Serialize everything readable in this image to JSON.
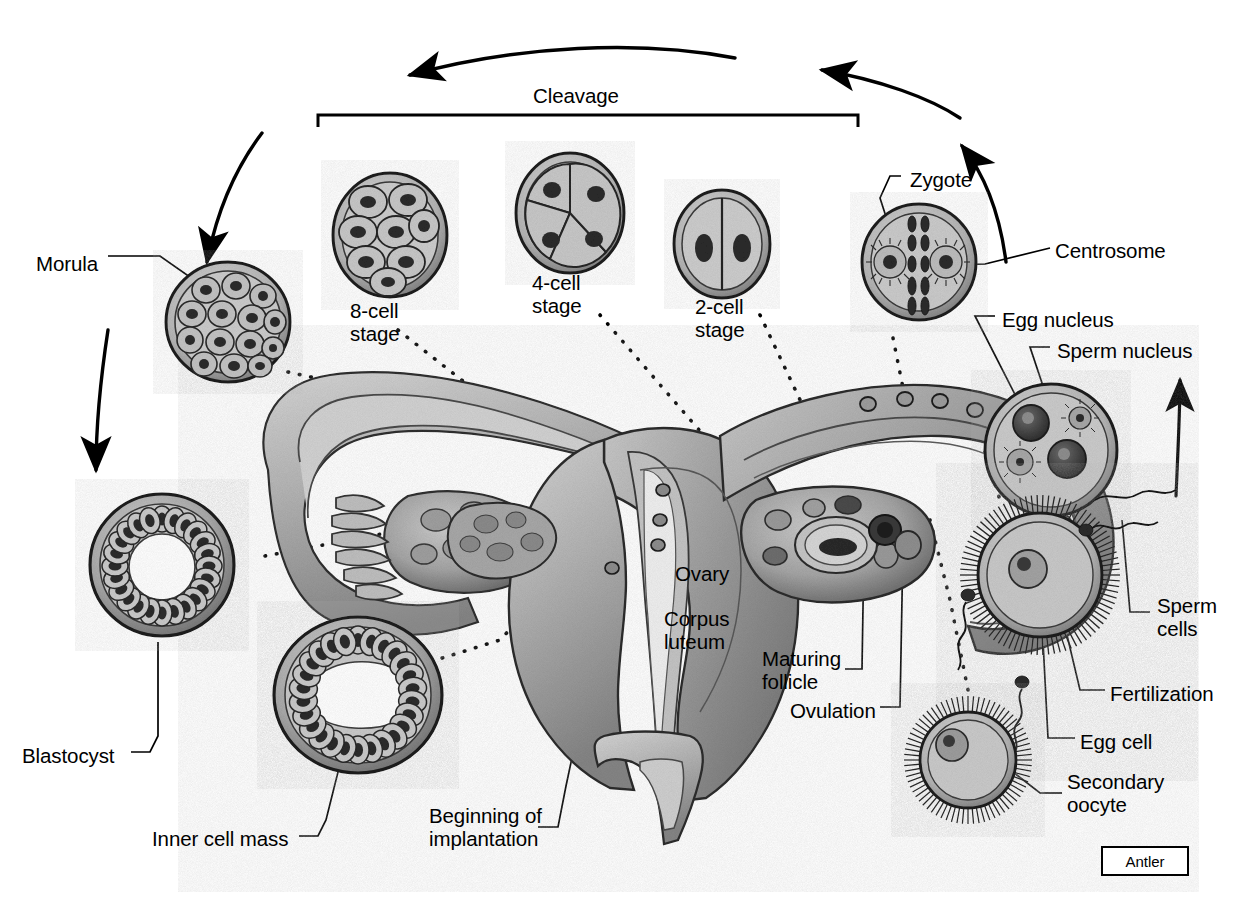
{
  "figure": {
    "credit_box": "Antler",
    "background_color": "#ffffff",
    "ink_color": "#000000"
  },
  "labels": [
    {
      "id": "cleavage",
      "text": "Cleavage",
      "x": 533,
      "y": 85,
      "name": "label-cleavage"
    },
    {
      "id": "morula",
      "text": "Morula",
      "x": 36,
      "y": 253,
      "name": "label-morula"
    },
    {
      "id": "eight_cell_stage",
      "text": "8-cell\nstage",
      "x": 350,
      "y": 300,
      "name": "label-8-cell-stage"
    },
    {
      "id": "four_cell_stage",
      "text": "4-cell\nstage",
      "x": 532,
      "y": 272,
      "name": "label-4-cell-stage"
    },
    {
      "id": "two_cell_stage",
      "text": "2-cell\nstage",
      "x": 695,
      "y": 296,
      "name": "label-2-cell-stage"
    },
    {
      "id": "zygote",
      "text": "Zygote",
      "x": 910,
      "y": 169,
      "name": "label-zygote"
    },
    {
      "id": "centrosome",
      "text": "Centrosome",
      "x": 1055,
      "y": 240,
      "name": "label-centrosome"
    },
    {
      "id": "egg_nucleus",
      "text": "Egg nucleus",
      "x": 1002,
      "y": 309,
      "name": "label-egg-nucleus"
    },
    {
      "id": "sperm_nucleus",
      "text": "Sperm nucleus",
      "x": 1057,
      "y": 340,
      "name": "label-sperm-nucleus"
    },
    {
      "id": "sperm_cells",
      "text": "Sperm\ncells",
      "x": 1157,
      "y": 595,
      "name": "label-sperm-cells"
    },
    {
      "id": "fertilization",
      "text": "Fertilization",
      "x": 1110,
      "y": 683,
      "name": "label-fertilization"
    },
    {
      "id": "egg_cell",
      "text": "Egg cell",
      "x": 1080,
      "y": 731,
      "name": "label-egg-cell"
    },
    {
      "id": "secondary_oocyte",
      "text": "Secondary\noocyte",
      "x": 1067,
      "y": 771,
      "name": "label-secondary-oocyte"
    },
    {
      "id": "ovulation",
      "text": "Ovulation",
      "x": 790,
      "y": 700,
      "name": "label-ovulation"
    },
    {
      "id": "maturing_follicle",
      "text": "Maturing\nfollicle",
      "x": 762,
      "y": 648,
      "name": "label-maturing-follicle"
    },
    {
      "id": "corpus_luteum",
      "text": "Corpus\nluteum",
      "x": 664,
      "y": 608,
      "name": "label-corpus-luteum"
    },
    {
      "id": "ovary",
      "text": "Ovary",
      "x": 675,
      "y": 563,
      "name": "label-ovary"
    },
    {
      "id": "beginning_implantation",
      "text": "Beginning of\nimplantation",
      "x": 429,
      "y": 805,
      "name": "label-beginning-of-implantation"
    },
    {
      "id": "inner_cell_mass",
      "text": "Inner cell mass",
      "x": 152,
      "y": 828,
      "name": "label-inner-cell-mass"
    },
    {
      "id": "blastocyst",
      "text": "Blastocyst",
      "x": 22,
      "y": 745,
      "name": "label-blastocyst"
    }
  ],
  "structures": [
    {
      "id": "morula_cell",
      "name": "morula-embryo",
      "note": "solid ball of ~16 cells"
    },
    {
      "id": "blastocyst_upper",
      "name": "blastocyst-embryo",
      "note": "hollow sphere with single cell layer"
    },
    {
      "id": "blastocyst_lower",
      "name": "blastocyst-inner-cell-mass-embryo",
      "note": "hollow sphere with inner cell mass"
    },
    {
      "id": "eight_cell",
      "name": "eight-cell-embryo",
      "note": "8 blastomeres"
    },
    {
      "id": "four_cell",
      "name": "four-cell-embryo",
      "note": "4 blastomeres"
    },
    {
      "id": "two_cell",
      "name": "two-cell-embryo",
      "note": "2 blastomeres"
    },
    {
      "id": "zygote_cell",
      "name": "zygote-cell",
      "note": "two centrosomes with chromosomes at metaphase"
    },
    {
      "id": "pronuclei_cell",
      "name": "pronuclei-cell",
      "note": "egg nucleus and sperm nucleus with asters"
    },
    {
      "id": "fertilization_cell",
      "name": "fertilization-egg-cell",
      "note": "egg with corona radiata, sperm entering"
    },
    {
      "id": "secondary_oocyte_cell",
      "name": "secondary-oocyte-cell",
      "note": "oocyte with corona radiata"
    },
    {
      "id": "uterus",
      "name": "uterus-anatomy",
      "note": "uterus, fallopian tubes, ovaries, cervix cutaway"
    }
  ],
  "arrows": [
    {
      "id": "arc_top",
      "name": "arrow-cleavage-direction-left",
      "direction": "counterclockwise"
    },
    {
      "id": "arc_right",
      "name": "arrow-cycle-right-upper",
      "direction": "counterclockwise"
    },
    {
      "id": "arc_right2",
      "name": "arrow-cycle-right-lower",
      "direction": "upward"
    },
    {
      "id": "arc_left1",
      "name": "arrow-cycle-left-upper",
      "direction": "downward"
    },
    {
      "id": "arc_left2",
      "name": "arrow-cycle-left-lower",
      "direction": "downward"
    }
  ]
}
